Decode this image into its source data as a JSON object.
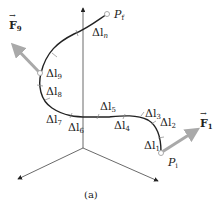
{
  "figure": {
    "caption": "(a)",
    "start_point": {
      "symbol": "P",
      "subscript": "i"
    },
    "end_point": {
      "symbol": "P",
      "subscript": "f"
    },
    "forces": [
      {
        "symbol": "F",
        "subscript": "1"
      },
      {
        "symbol": "F",
        "subscript": "9"
      }
    ],
    "segments": [
      {
        "symbol": "Δl",
        "subscript": "1"
      },
      {
        "symbol": "Δl",
        "subscript": "2"
      },
      {
        "symbol": "Δl",
        "subscript": "3"
      },
      {
        "symbol": "Δl",
        "subscript": "4"
      },
      {
        "symbol": "Δl",
        "subscript": "5"
      },
      {
        "symbol": "Δl",
        "subscript": "6"
      },
      {
        "symbol": "Δl",
        "subscript": "7"
      },
      {
        "symbol": "Δl",
        "subscript": "8"
      },
      {
        "symbol": "Δl",
        "subscript": "9"
      },
      {
        "symbol": "Δl",
        "subscript": "n"
      }
    ],
    "colors": {
      "curve": "#222222",
      "axes": "#333333",
      "force_arrow": "#a9a9a9",
      "point": "#bfbfbf"
    }
  }
}
